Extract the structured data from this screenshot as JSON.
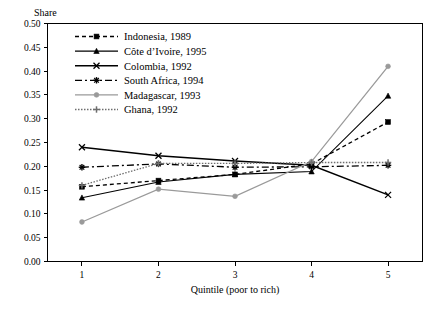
{
  "chart_data": {
    "type": "line",
    "title": "",
    "ylabel": "Share",
    "xlabel": "Quintile (poor to rich)",
    "categories": [
      "1",
      "2",
      "3",
      "4",
      "5"
    ],
    "x": [
      1,
      2,
      3,
      4,
      5
    ],
    "xlim": [
      0.55,
      5.45
    ],
    "ylim": [
      0.0,
      0.5
    ],
    "yticks": [
      "0.00",
      "0.05",
      "0.10",
      "0.15",
      "0.20",
      "0.25",
      "0.30",
      "0.35",
      "0.40",
      "0.45",
      "0.50"
    ],
    "ytick_values": [
      0.0,
      0.05,
      0.1,
      0.15,
      0.2,
      0.25,
      0.3,
      0.35,
      0.4,
      0.45,
      0.5
    ],
    "grid": false,
    "legend_position": "top-left-inside",
    "series": [
      {
        "name": "Indonesia, 1989",
        "values": [
          0.157,
          0.17,
          0.183,
          0.205,
          0.293
        ],
        "color": "#000000",
        "dash": "4,3",
        "marker": "square",
        "width": 1.3
      },
      {
        "name": "Côte d’Ivoire, 1995",
        "values": [
          0.134,
          0.167,
          0.183,
          0.189,
          0.348
        ],
        "color": "#000000",
        "dash": "none",
        "marker": "triangle",
        "width": 1.1
      },
      {
        "name": "Colombia, 1992",
        "values": [
          0.24,
          0.222,
          0.211,
          0.202,
          0.14
        ],
        "color": "#000000",
        "dash": "none",
        "marker": "cross",
        "width": 1.5
      },
      {
        "name": "South Africa, 1994",
        "values": [
          0.198,
          0.205,
          0.198,
          0.199,
          0.202
        ],
        "color": "#000000",
        "dash": "7,3,2,3",
        "marker": "star",
        "width": 1.3
      },
      {
        "name": "Madagascar, 1993",
        "values": [
          0.083,
          0.152,
          0.137,
          0.21,
          0.41
        ],
        "color": "#9a9a9a",
        "dash": "none",
        "marker": "circle",
        "width": 1.3
      },
      {
        "name": "Ghana, 1992",
        "values": [
          0.16,
          0.206,
          0.206,
          0.208,
          0.208
        ],
        "color": "#6e6e6e",
        "dash": "1.5,1.5",
        "marker": "plus",
        "width": 1.3
      }
    ]
  },
  "legend": {
    "items": [
      {
        "label": "Indonesia, 1989"
      },
      {
        "label": "Côte d’Ivoire, 1995"
      },
      {
        "label": "Colombia, 1992"
      },
      {
        "label": "South Africa, 1994"
      },
      {
        "label": "Madagascar, 1993"
      },
      {
        "label": "Ghana, 1992"
      }
    ]
  }
}
